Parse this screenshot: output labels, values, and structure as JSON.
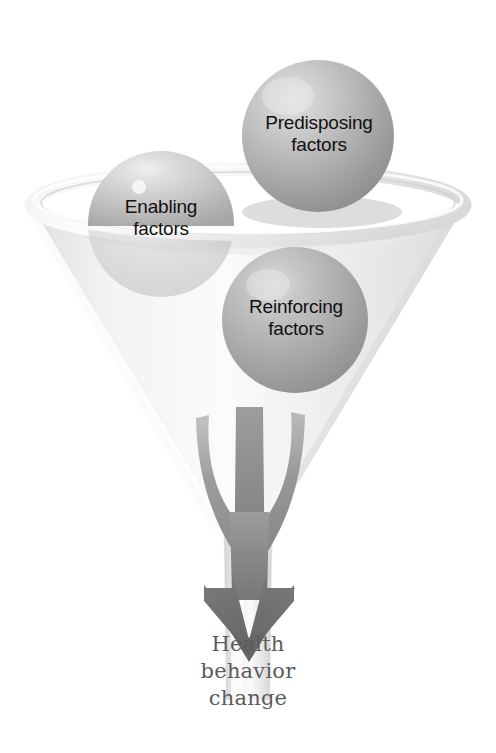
{
  "figure": {
    "background_color": "#ffffff"
  },
  "funnel": {
    "name": "funnel",
    "rim_color": "#e9e9e9",
    "body_color": "#efefef",
    "shadow_color": "#d6d6d6"
  },
  "spheres": [
    {
      "id": "predisposing",
      "line1": "Predisposing",
      "line2": "factors",
      "color": "#a8a8a8",
      "highlight_color": "#d8d8d8",
      "cx": 318,
      "cy": 136,
      "r": 76
    },
    {
      "id": "enabling",
      "line1": "Enabling",
      "line2": "factors",
      "color": "#bfbfbf",
      "highlight_color": "#e2e2e2",
      "cx": 161,
      "cy": 224,
      "r": 73
    },
    {
      "id": "reinforcing",
      "line1": "Reinforcing",
      "line2": "factors",
      "color": "#ababab",
      "highlight_color": "#cfcfcf",
      "cx": 295,
      "cy": 320,
      "r": 73
    }
  ],
  "arrow": {
    "name": "convergence-arrow",
    "stream_color_light": "#a6a6a6",
    "stream_color_mid": "#949494",
    "head_color": "#6e6e6e",
    "streams": 3
  },
  "outcome": {
    "line1": "Health",
    "line2": "behavior",
    "line3": "change",
    "color": "#5b5b5b"
  }
}
